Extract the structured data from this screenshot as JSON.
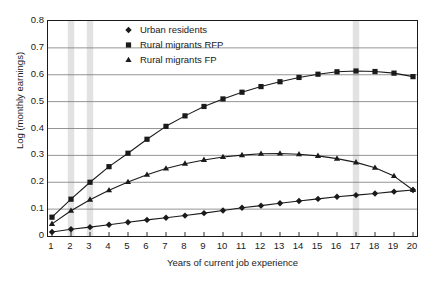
{
  "chart_data": {
    "type": "line",
    "title": "",
    "xlabel": "Years of current job experience",
    "ylabel": "Log (monthly earnings)",
    "xlim": [
      1,
      20
    ],
    "ylim": [
      0,
      0.8
    ],
    "grid": "horizontal",
    "legend_position": "top-center",
    "x": [
      1,
      2,
      3,
      4,
      5,
      6,
      7,
      8,
      9,
      10,
      11,
      12,
      13,
      14,
      15,
      16,
      17,
      18,
      19,
      20
    ],
    "xtick_labels": [
      "1",
      "2",
      "3",
      "4",
      "5",
      "6",
      "7",
      "8",
      "9",
      "10",
      "11",
      "12",
      "13",
      "14",
      "15",
      "16",
      "17",
      "18",
      "19",
      "20"
    ],
    "ytick_labels": [
      "0",
      "0.1",
      "0.2",
      "0.3",
      "0.4",
      "0.5",
      "0.6",
      "0.7",
      "0.8"
    ],
    "ytick_values": [
      0,
      0.1,
      0.2,
      0.3,
      0.4,
      0.5,
      0.6,
      0.7,
      0.8
    ],
    "shaded_bands": [
      2,
      3,
      17
    ],
    "series": [
      {
        "name": "Urban residents",
        "marker": "diamond",
        "color": "#1a1a1a",
        "values": [
          0.015,
          0.025,
          0.033,
          0.042,
          0.051,
          0.06,
          0.068,
          0.076,
          0.085,
          0.095,
          0.105,
          0.113,
          0.122,
          0.13,
          0.138,
          0.146,
          0.152,
          0.158,
          0.165,
          0.171
        ]
      },
      {
        "name": "Rural migrants RFP",
        "marker": "square",
        "color": "#1a1a1a",
        "values": [
          0.07,
          0.137,
          0.2,
          0.258,
          0.308,
          0.36,
          0.408,
          0.447,
          0.482,
          0.51,
          0.535,
          0.556,
          0.574,
          0.59,
          0.602,
          0.611,
          0.614,
          0.612,
          0.606,
          0.593
        ]
      },
      {
        "name": "Rural migrants FP",
        "marker": "triangle",
        "color": "#1a1a1a",
        "values": [
          0.045,
          0.094,
          0.135,
          0.17,
          0.201,
          0.228,
          0.251,
          0.269,
          0.283,
          0.294,
          0.301,
          0.306,
          0.307,
          0.304,
          0.298,
          0.288,
          0.274,
          0.254,
          0.223,
          0.171
        ]
      }
    ]
  },
  "legend": {
    "items": [
      {
        "label": "Urban residents",
        "marker": "diamond"
      },
      {
        "label": "Rural migrants RFP",
        "marker": "square"
      },
      {
        "label": "Rural migrants FP",
        "marker": "triangle"
      }
    ]
  },
  "axes": {
    "x_title": "Years of current job experience",
    "y_title": "Log (monthly earnings)"
  }
}
